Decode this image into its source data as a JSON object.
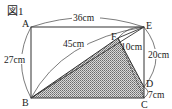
{
  "figure": {
    "title": "図1",
    "points": {
      "A": {
        "label": "A",
        "x": 31,
        "y": 27
      },
      "E": {
        "label": "E",
        "x": 144,
        "y": 27
      },
      "B": {
        "label": "B",
        "x": 31,
        "y": 98
      },
      "C": {
        "label": "C",
        "x": 144,
        "y": 98
      },
      "F": {
        "label": "F",
        "x": 118,
        "y": 38
      },
      "D": {
        "label": "D",
        "x": 144,
        "y": 87
      }
    },
    "measurements": {
      "AE": "36cm",
      "AB": "27cm",
      "BE": "45cm",
      "EF": "10cm",
      "ED": "20cm",
      "DC": "7cm"
    },
    "colors": {
      "line": "#333333",
      "shade": "#9a9a9a"
    }
  }
}
